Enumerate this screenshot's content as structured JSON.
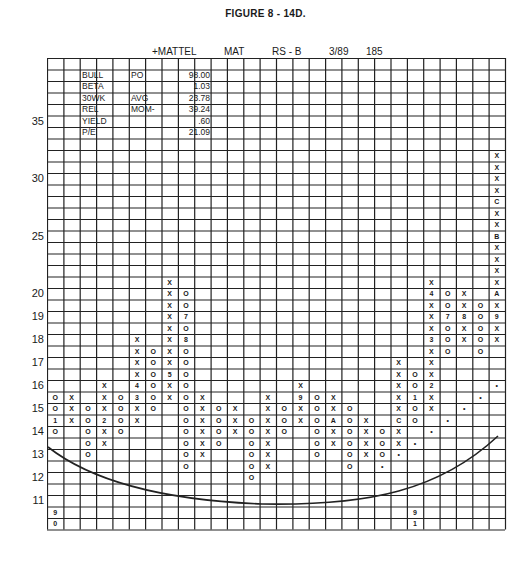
{
  "figure_title": "FIGURE 8 - 14D.",
  "header": {
    "name": "+MATTEL",
    "ticker": "MAT",
    "rs": "RS - B",
    "date": "3/89",
    "number": "185"
  },
  "info_table": [
    {
      "label": "BULL",
      "key": "PO",
      "value": "98.00"
    },
    {
      "label": "BETA",
      "key": "",
      "value": "1.03"
    },
    {
      "label": "30WK",
      "key": "AVG",
      "value": "23.78"
    },
    {
      "label": "REL",
      "key": "MOM-",
      "value": "39.24"
    },
    {
      "label": "YIELD",
      "key": "",
      "value": ".60"
    },
    {
      "label": "P/E",
      "key": "",
      "value": "21.09"
    }
  ],
  "chart_data": {
    "type": "point-and-figure",
    "title": "FIGURE 8 - 14D.",
    "subtitle": "+MATTEL MAT RS - B 3/89 185",
    "columns": 28,
    "rows": 41,
    "y_tick_labels": [
      {
        "label": "35",
        "row": 5
      },
      {
        "label": "30",
        "row": 10
      },
      {
        "label": "25",
        "row": 15
      },
      {
        "label": "20",
        "row": 20
      },
      {
        "label": "19",
        "row": 22
      },
      {
        "label": "18",
        "row": 24
      },
      {
        "label": "17",
        "row": 26
      },
      {
        "label": "16",
        "row": 28
      },
      {
        "label": "15",
        "row": 30
      },
      {
        "label": "14",
        "row": 32
      },
      {
        "label": "13",
        "row": 34
      },
      {
        "label": "12",
        "row": 36
      },
      {
        "label": "11",
        "row": 38
      }
    ],
    "box_size_note": "1 point per box above 20, 0.5 point per box below 20",
    "cells": [
      [
        "c0",
        "29",
        "O"
      ],
      [
        "c0",
        "30",
        "O"
      ],
      [
        "c0",
        "31",
        "1"
      ],
      [
        "c0",
        "32",
        "O"
      ],
      [
        "c1",
        "29",
        "X"
      ],
      [
        "c1",
        "30",
        "X"
      ],
      [
        "c1",
        "31",
        "X"
      ],
      [
        "c2",
        "30",
        "O"
      ],
      [
        "c2",
        "31",
        "O"
      ],
      [
        "c2",
        "32",
        "O"
      ],
      [
        "c2",
        "33",
        "O"
      ],
      [
        "c2",
        "34",
        "O"
      ],
      [
        "c3",
        "28",
        "X"
      ],
      [
        "c3",
        "29",
        "X"
      ],
      [
        "c3",
        "30",
        "X"
      ],
      [
        "c3",
        "31",
        "2"
      ],
      [
        "c3",
        "32",
        "X"
      ],
      [
        "c3",
        "33",
        "X"
      ],
      [
        "c4",
        "29",
        "O"
      ],
      [
        "c4",
        "30",
        "O"
      ],
      [
        "c4",
        "31",
        "O"
      ],
      [
        "c4",
        "32",
        "O"
      ],
      [
        "c5",
        "24",
        "X"
      ],
      [
        "c5",
        "25",
        "X"
      ],
      [
        "c5",
        "26",
        "X"
      ],
      [
        "c5",
        "27",
        "X"
      ],
      [
        "c5",
        "28",
        "4"
      ],
      [
        "c5",
        "29",
        "3"
      ],
      [
        "c5",
        "30",
        "X"
      ],
      [
        "c5",
        "31",
        "X"
      ],
      [
        "c6",
        "25",
        "O"
      ],
      [
        "c6",
        "26",
        "O"
      ],
      [
        "c6",
        "27",
        "O"
      ],
      [
        "c6",
        "28",
        "O"
      ],
      [
        "c6",
        "29",
        "O"
      ],
      [
        "c6",
        "30",
        "O"
      ],
      [
        "c7",
        "19",
        "X"
      ],
      [
        "c7",
        "20",
        "X"
      ],
      [
        "c7",
        "21",
        "X"
      ],
      [
        "c7",
        "22",
        "X"
      ],
      [
        "c7",
        "23",
        "X"
      ],
      [
        "c7",
        "24",
        "X"
      ],
      [
        "c7",
        "25",
        "X"
      ],
      [
        "c7",
        "26",
        "X"
      ],
      [
        "c7",
        "27",
        "5"
      ],
      [
        "c7",
        "28",
        "X"
      ],
      [
        "c7",
        "29",
        "X"
      ],
      [
        "c8",
        "20",
        "O"
      ],
      [
        "c8",
        "21",
        "O"
      ],
      [
        "c8",
        "22",
        "7"
      ],
      [
        "c8",
        "23",
        "O"
      ],
      [
        "c8",
        "24",
        "8"
      ],
      [
        "c8",
        "25",
        "O"
      ],
      [
        "c8",
        "26",
        "O"
      ],
      [
        "c8",
        "27",
        "O"
      ],
      [
        "c8",
        "28",
        "O"
      ],
      [
        "c8",
        "29",
        "O"
      ],
      [
        "c8",
        "30",
        "O"
      ],
      [
        "c8",
        "31",
        "O"
      ],
      [
        "c8",
        "32",
        "O"
      ],
      [
        "c8",
        "33",
        "O"
      ],
      [
        "c8",
        "34",
        "O"
      ],
      [
        "c8",
        "35",
        "O"
      ],
      [
        "c9",
        "29",
        "X"
      ],
      [
        "c9",
        "30",
        "X"
      ],
      [
        "c9",
        "31",
        "X"
      ],
      [
        "c9",
        "32",
        "X"
      ],
      [
        "c9",
        "33",
        "X"
      ],
      [
        "c9",
        "34",
        "X"
      ],
      [
        "c10",
        "30",
        "O"
      ],
      [
        "c10",
        "31",
        "O"
      ],
      [
        "c10",
        "32",
        "O"
      ],
      [
        "c10",
        "33",
        "O"
      ],
      [
        "c11",
        "30",
        "X"
      ],
      [
        "c11",
        "31",
        "X"
      ],
      [
        "c11",
        "32",
        "X"
      ],
      [
        "c12",
        "31",
        "O"
      ],
      [
        "c12",
        "32",
        "O"
      ],
      [
        "c12",
        "33",
        "O"
      ],
      [
        "c12",
        "34",
        "O"
      ],
      [
        "c12",
        "35",
        "O"
      ],
      [
        "c12",
        "36",
        "O"
      ],
      [
        "c13",
        "29",
        "X"
      ],
      [
        "c13",
        "30",
        "X"
      ],
      [
        "c13",
        "31",
        "X"
      ],
      [
        "c13",
        "32",
        "X"
      ],
      [
        "c13",
        "33",
        "X"
      ],
      [
        "c13",
        "34",
        "X"
      ],
      [
        "c13",
        "35",
        "X"
      ],
      [
        "c14",
        "30",
        "O"
      ],
      [
        "c14",
        "31",
        "O"
      ],
      [
        "c14",
        "32",
        "O"
      ],
      [
        "c15",
        "28",
        "X"
      ],
      [
        "c15",
        "29",
        "9"
      ],
      [
        "c15",
        "30",
        "X"
      ],
      [
        "c15",
        "31",
        "X"
      ],
      [
        "c16",
        "29",
        "O"
      ],
      [
        "c16",
        "30",
        "O"
      ],
      [
        "c16",
        "31",
        "O"
      ],
      [
        "c16",
        "32",
        "O"
      ],
      [
        "c16",
        "33",
        "O"
      ],
      [
        "c16",
        "34",
        "O"
      ],
      [
        "c17",
        "29",
        "X"
      ],
      [
        "c17",
        "30",
        "X"
      ],
      [
        "c17",
        "31",
        "A"
      ],
      [
        "c17",
        "32",
        "X"
      ],
      [
        "c17",
        "33",
        "X"
      ],
      [
        "c18",
        "30",
        "O"
      ],
      [
        "c18",
        "31",
        "O"
      ],
      [
        "c18",
        "32",
        "O"
      ],
      [
        "c18",
        "33",
        "O"
      ],
      [
        "c18",
        "34",
        "O"
      ],
      [
        "c18",
        "35",
        "O"
      ],
      [
        "c19",
        "31",
        "X"
      ],
      [
        "c19",
        "32",
        "X"
      ],
      [
        "c19",
        "33",
        "X"
      ],
      [
        "c19",
        "34",
        "X"
      ],
      [
        "c20",
        "32",
        "O"
      ],
      [
        "c20",
        "33",
        "O"
      ],
      [
        "c20",
        "34",
        "O"
      ],
      [
        "c20",
        "35",
        "•"
      ],
      [
        "c21",
        "26",
        "X"
      ],
      [
        "c21",
        "27",
        "X"
      ],
      [
        "c21",
        "28",
        "X"
      ],
      [
        "c21",
        "29",
        "X"
      ],
      [
        "c21",
        "30",
        "X"
      ],
      [
        "c21",
        "31",
        "C"
      ],
      [
        "c21",
        "32",
        "X"
      ],
      [
        "c21",
        "33",
        "X"
      ],
      [
        "c21",
        "34",
        "•"
      ],
      [
        "c22",
        "27",
        "O"
      ],
      [
        "c22",
        "28",
        "O"
      ],
      [
        "c22",
        "29",
        "1"
      ],
      [
        "c22",
        "30",
        "O"
      ],
      [
        "c22",
        "31",
        "O"
      ],
      [
        "c22",
        "33",
        "•"
      ],
      [
        "c23",
        "19",
        "X"
      ],
      [
        "c23",
        "20",
        "4"
      ],
      [
        "c23",
        "21",
        "X"
      ],
      [
        "c23",
        "22",
        "X"
      ],
      [
        "c23",
        "23",
        "X"
      ],
      [
        "c23",
        "24",
        "3"
      ],
      [
        "c23",
        "25",
        "X"
      ],
      [
        "c23",
        "26",
        "X"
      ],
      [
        "c23",
        "27",
        "X"
      ],
      [
        "c23",
        "28",
        "2"
      ],
      [
        "c23",
        "29",
        "X"
      ],
      [
        "c23",
        "30",
        "X"
      ],
      [
        "c23",
        "32",
        "•"
      ],
      [
        "c24",
        "20",
        "O"
      ],
      [
        "c24",
        "21",
        "O"
      ],
      [
        "c24",
        "22",
        "7"
      ],
      [
        "c24",
        "23",
        "O"
      ],
      [
        "c24",
        "24",
        "O"
      ],
      [
        "c24",
        "25",
        "O"
      ],
      [
        "c24",
        "31",
        "•"
      ],
      [
        "c25",
        "20",
        "X"
      ],
      [
        "c25",
        "21",
        "X"
      ],
      [
        "c25",
        "22",
        "8"
      ],
      [
        "c25",
        "23",
        "X"
      ],
      [
        "c25",
        "24",
        "X"
      ],
      [
        "c25",
        "30",
        "•"
      ],
      [
        "c26",
        "21",
        "O"
      ],
      [
        "c26",
        "22",
        "O"
      ],
      [
        "c26",
        "23",
        "O"
      ],
      [
        "c26",
        "24",
        "O"
      ],
      [
        "c26",
        "25",
        "O"
      ],
      [
        "c26",
        "29",
        "•"
      ],
      [
        "c27",
        "8",
        "X"
      ],
      [
        "c27",
        "9",
        "X"
      ],
      [
        "c27",
        "10",
        "X"
      ],
      [
        "c27",
        "11",
        "X"
      ],
      [
        "c27",
        "12",
        "C"
      ],
      [
        "c27",
        "13",
        "X"
      ],
      [
        "c27",
        "14",
        "X"
      ],
      [
        "c27",
        "15",
        "B"
      ],
      [
        "c27",
        "16",
        "X"
      ],
      [
        "c27",
        "17",
        "X"
      ],
      [
        "c27",
        "18",
        "X"
      ],
      [
        "c27",
        "19",
        "X"
      ],
      [
        "c27",
        "20",
        "A"
      ],
      [
        "c27",
        "21",
        "X"
      ],
      [
        "c27",
        "22",
        "9"
      ],
      [
        "c27",
        "23",
        "X"
      ],
      [
        "c27",
        "24",
        "X"
      ],
      [
        "c27",
        "28",
        "•"
      ],
      [
        "c0",
        "39",
        "9"
      ],
      [
        "c0",
        "40",
        "0"
      ],
      [
        "c22",
        "39",
        "9"
      ],
      [
        "c22",
        "40",
        "1"
      ]
    ],
    "annotations": [
      "Saucer-shaped curve drawn beneath base from column 0 to column 27"
    ],
    "grid": true
  }
}
